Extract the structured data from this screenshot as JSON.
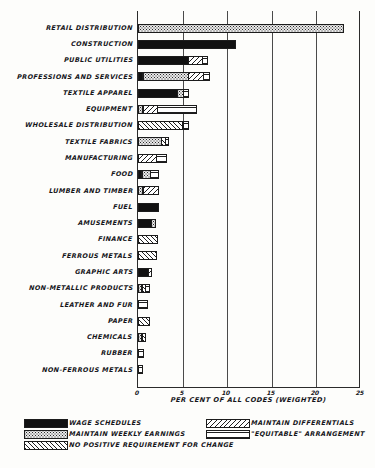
{
  "chart_data": {
    "type": "bar",
    "orientation": "horizontal",
    "stacked": true,
    "title": "",
    "xlabel": "PER CENT OF ALL CODES (WEIGHTED)",
    "ylabel": "",
    "xlim": [
      0,
      25
    ],
    "xticks": [
      0,
      5,
      10,
      15,
      20,
      25
    ],
    "xtick_labels": [
      "0",
      "5",
      "10",
      "15",
      "20",
      "25"
    ],
    "grid": true,
    "legend_position": "below",
    "categories": [
      "RETAIL DISTRIBUTION",
      "CONSTRUCTION",
      "PUBLIC UTILITIES",
      "PROFESSIONS AND SERVICES",
      "TEXTILE APPAREL",
      "EQUIPMENT",
      "WHOLESALE DISTRIBUTION",
      "TEXTILE FABRICS",
      "MANUFACTURING",
      "FOOD",
      "LUMBER AND TIMBER",
      "FUEL",
      "AMUSEMENTS",
      "FINANCE",
      "FERROUS METALS",
      "GRAPHIC ARTS",
      "NON-METALLIC PRODUCTS",
      "LEATHER AND FUR",
      "PAPER",
      "CHEMICALS",
      "RUBBER",
      "NON-FERROUS METALS"
    ],
    "series": [
      {
        "name": "WAGE SCHEDULES",
        "key": "wage",
        "pattern": "solid-black",
        "values": [
          0.0,
          11.0,
          5.7,
          0.6,
          4.5,
          0.0,
          0.0,
          0.0,
          0.0,
          0.5,
          0.0,
          2.3,
          1.6,
          0.0,
          0.0,
          1.2,
          0.0,
          0.0,
          0.0,
          0.0,
          0.0,
          0.0
        ]
      },
      {
        "name": "MAINTAIN WEEKLY EARNINGS",
        "key": "weekly",
        "pattern": "stipple-dots",
        "values": [
          23.1,
          0.0,
          0.0,
          5.2,
          0.7,
          0.6,
          0.0,
          2.7,
          0.0,
          1.0,
          0.6,
          0.0,
          0.5,
          0.0,
          0.0,
          0.0,
          0.5,
          0.0,
          0.0,
          0.5,
          0.0,
          0.0
        ]
      },
      {
        "name": "NO POSITIVE REQUIREMENT FOR CHANGE",
        "key": "nochange",
        "pattern": "hatch-45",
        "values": [
          0.0,
          0.0,
          0.0,
          0.0,
          0.0,
          0.0,
          5.1,
          0.5,
          0.0,
          0.0,
          0.0,
          0.0,
          0.0,
          2.2,
          2.1,
          0.0,
          0.5,
          0.0,
          1.4,
          0.5,
          0.0,
          0.0
        ]
      },
      {
        "name": "MAINTAIN DIFFERENTIALS",
        "key": "differentials",
        "pattern": "hatch-135",
        "values": [
          0.0,
          0.0,
          1.7,
          1.8,
          0.0,
          1.7,
          0.0,
          0.0,
          2.1,
          0.0,
          1.8,
          0.0,
          0.0,
          0.0,
          0.0,
          0.5,
          0.0,
          0.0,
          0.0,
          0.0,
          0.0,
          0.0
        ]
      },
      {
        "name": "\"EQUITABLE\" ARRANGEMENT",
        "key": "equitable",
        "pattern": "horizontal-lines",
        "values": [
          0.0,
          0.0,
          0.6,
          0.7,
          0.7,
          4.5,
          0.7,
          0.4,
          1.2,
          1.0,
          0.0,
          0.0,
          0.0,
          0.0,
          0.0,
          0.0,
          0.5,
          1.1,
          0.0,
          0.0,
          0.7,
          0.6
        ]
      }
    ],
    "totals": [
      23.1,
      11.0,
      8.0,
      8.3,
      5.9,
      6.8,
      5.8,
      3.6,
      3.3,
      2.5,
      2.4,
      2.3,
      2.1,
      2.2,
      2.1,
      1.7,
      1.5,
      1.1,
      1.4,
      1.0,
      0.7,
      0.6
    ]
  },
  "axis": {
    "x_title": "PER CENT OF ALL CODES (WEIGHTED)",
    "ticks": [
      "0",
      "5",
      "10",
      "15",
      "20",
      "25"
    ]
  },
  "legend": {
    "items": [
      {
        "label": "WAGE SCHEDULES",
        "pattern": "solid-black"
      },
      {
        "label": "MAINTAIN WEEKLY EARNINGS",
        "pattern": "stipple-dots"
      },
      {
        "label": "NO POSITIVE REQUIREMENT FOR CHANGE",
        "pattern": "hatch-45"
      },
      {
        "label": "MAINTAIN DIFFERENTIALS",
        "pattern": "hatch-135"
      },
      {
        "label": "\"EQUITABLE\" ARRANGEMENT",
        "pattern": "horizontal-lines"
      }
    ]
  },
  "colors": {
    "ink": "#15151a",
    "paper": "#fdfdfb",
    "black_fill": "#111111",
    "grid": "#4a4a4a"
  }
}
